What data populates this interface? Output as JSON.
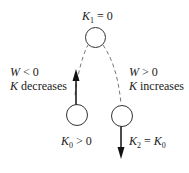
{
  "diagram": {
    "top_label": {
      "var": "K",
      "sub": "1",
      "rest": " = 0"
    },
    "left_label": {
      "var": "K",
      "sub": "0",
      "rest": " > 0"
    },
    "right_label": {
      "var": "K",
      "sub": "2",
      "rest": " = ",
      "var2": "K",
      "sub2": "0"
    },
    "left_note": {
      "line1_var": "W",
      "line1_rest": " < 0",
      "line2_var": "K",
      "line2_rest": " decreases"
    },
    "right_note": {
      "line1_var": "W",
      "line1_rest": " > 0",
      "line2_var": "K",
      "line2_rest": " increases"
    },
    "nodes": [
      {
        "id": "top",
        "cx": 95.5,
        "cy": 37.5,
        "r": 10
      },
      {
        "id": "left",
        "cx": 77,
        "cy": 115,
        "r": 10.5
      },
      {
        "id": "right",
        "cx": 122,
        "cy": 116,
        "r": 10.5
      }
    ],
    "arrows": [
      {
        "id": "up-arrow",
        "direction": "up"
      },
      {
        "id": "down-arrow",
        "direction": "down"
      }
    ],
    "colors": {
      "stroke": "#333333",
      "dash": "#777777"
    }
  }
}
